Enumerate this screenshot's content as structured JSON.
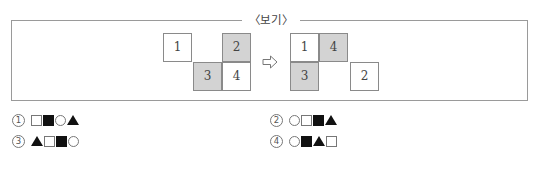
{
  "box": {
    "title": "〈보기〉",
    "left_figure": {
      "cells": [
        {
          "label": "1",
          "shaded": false,
          "x": 163,
          "y": 33
        },
        {
          "label": "2",
          "shaded": true,
          "x": 222,
          "y": 33
        },
        {
          "label": "3",
          "shaded": true,
          "x": 192,
          "y": 62
        },
        {
          "label": "4",
          "shaded": false,
          "x": 222,
          "y": 62
        }
      ]
    },
    "arrow": "⇨",
    "right_figure": {
      "cells": [
        {
          "label": "1",
          "shaded": false,
          "x": 290,
          "y": 33
        },
        {
          "label": "4",
          "shaded": true,
          "x": 319,
          "y": 33
        },
        {
          "label": "3",
          "shaded": true,
          "x": 290,
          "y": 62
        },
        {
          "label": "2",
          "shaded": false,
          "x": 350,
          "y": 62
        }
      ]
    }
  },
  "options": [
    {
      "number": "1",
      "symbols": [
        "square-empty",
        "square-filled",
        "circle",
        "triangle"
      ]
    },
    {
      "number": "2",
      "symbols": [
        "circle",
        "square-empty",
        "square-filled",
        "triangle"
      ]
    },
    {
      "number": "3",
      "symbols": [
        "triangle",
        "square-empty",
        "square-filled",
        "circle"
      ]
    },
    {
      "number": "4",
      "symbols": [
        "circle",
        "square-filled",
        "triangle",
        "square-empty"
      ]
    }
  ]
}
